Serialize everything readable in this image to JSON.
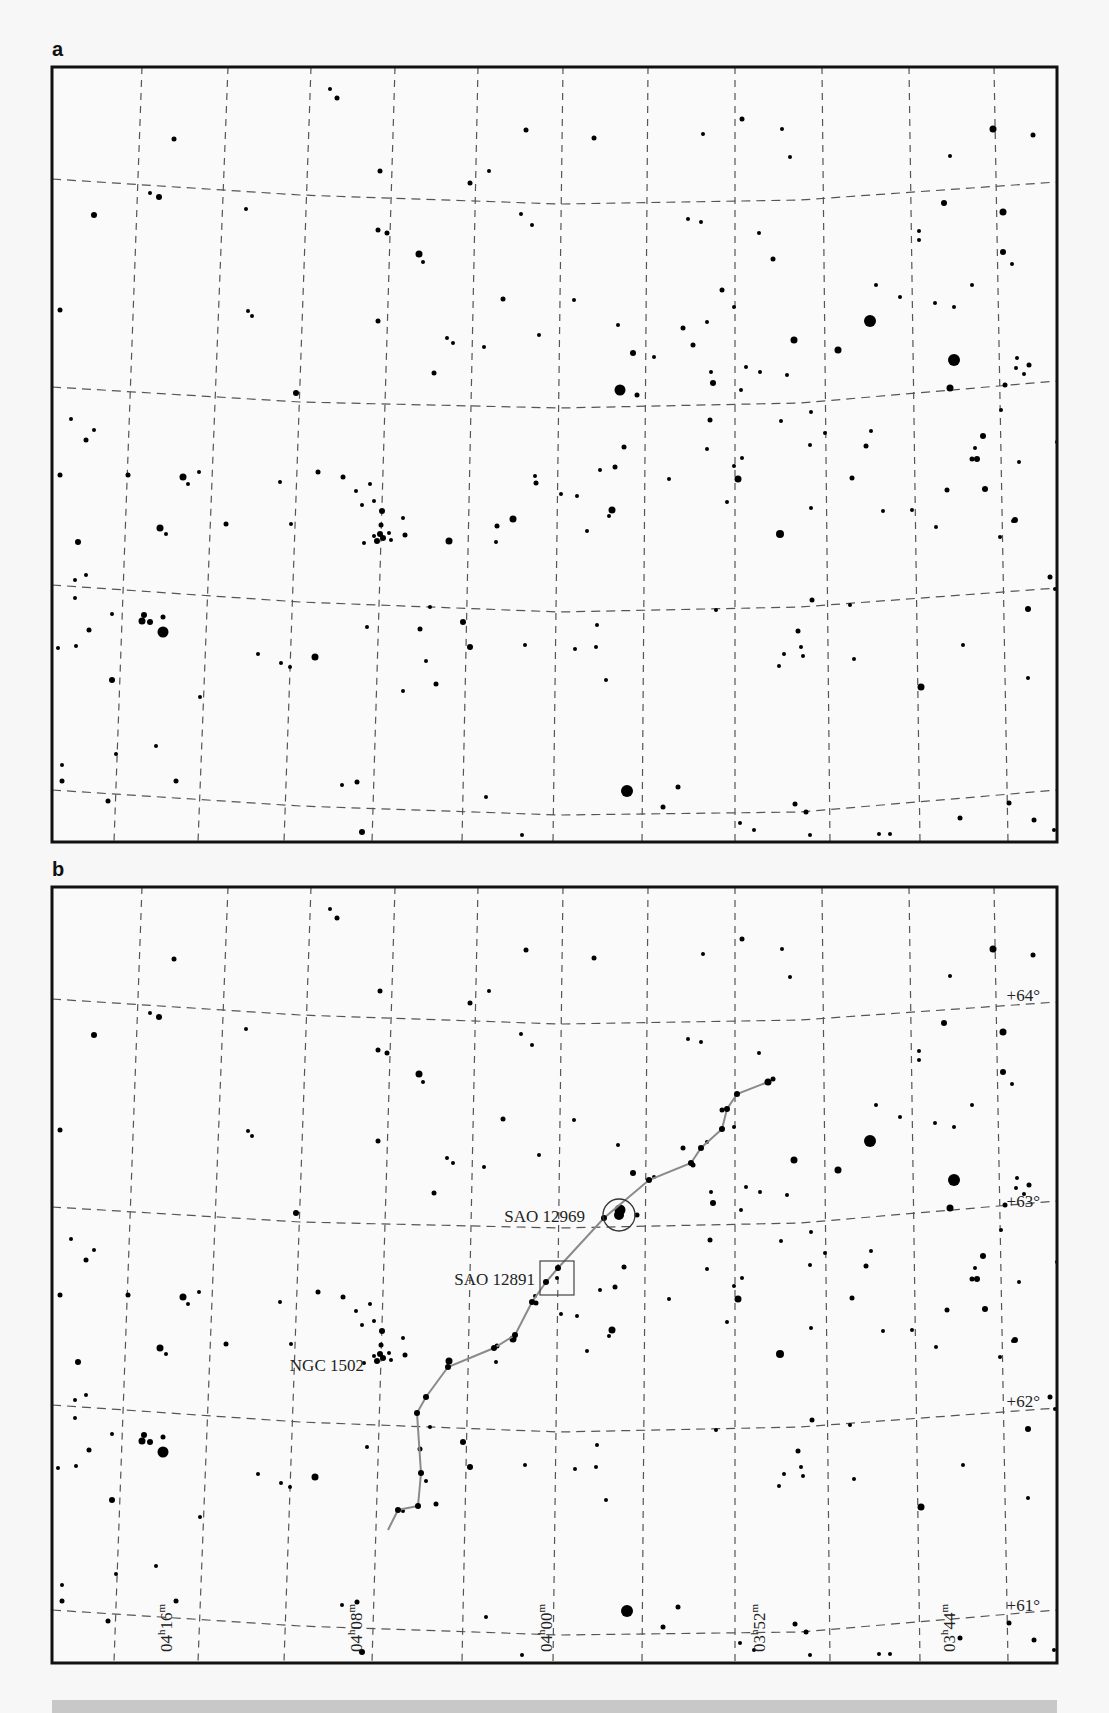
{
  "panels": [
    {
      "label": "a",
      "x": 52,
      "y": 67,
      "w": 1005,
      "h": 775
    },
    {
      "label": "b",
      "x": 52,
      "y": 887,
      "w": 1005,
      "h": 776
    }
  ],
  "grid": {
    "ra_lines_top_x": [
      142,
      311,
      478,
      563,
      648,
      735,
      822,
      1007
    ],
    "ra_lines": [
      [
        [
          142,
          67
        ],
        [
          114,
          842
        ]
      ],
      [
        [
          228,
          67
        ],
        [
          198,
          842
        ]
      ],
      [
        [
          311,
          67
        ],
        [
          284,
          842
        ]
      ],
      [
        [
          395,
          67
        ],
        [
          372,
          842
        ]
      ],
      [
        [
          478,
          67
        ],
        [
          462,
          842
        ]
      ],
      [
        [
          563,
          67
        ],
        [
          553,
          842
        ]
      ],
      [
        [
          648,
          67
        ],
        [
          642,
          842
        ]
      ],
      [
        [
          735,
          67
        ],
        [
          735,
          842
        ]
      ],
      [
        [
          822,
          67
        ],
        [
          830,
          842
        ]
      ],
      [
        [
          909,
          67
        ],
        [
          920,
          842
        ]
      ],
      [
        [
          994,
          67
        ],
        [
          1008,
          842
        ]
      ]
    ],
    "dec_lines": [
      [
        [
          52,
          179
        ],
        [
          300,
          195
        ],
        [
          560,
          204
        ],
        [
          800,
          200
        ],
        [
          1057,
          182
        ]
      ],
      [
        [
          52,
          387
        ],
        [
          300,
          402
        ],
        [
          560,
          408
        ],
        [
          800,
          403
        ],
        [
          1057,
          381
        ]
      ],
      [
        [
          52,
          585
        ],
        [
          300,
          602
        ],
        [
          560,
          612
        ],
        [
          800,
          607
        ],
        [
          1057,
          588
        ]
      ],
      [
        [
          52,
          790
        ],
        [
          300,
          806
        ],
        [
          560,
          815
        ],
        [
          800,
          812
        ],
        [
          1057,
          790
        ]
      ]
    ]
  },
  "dec_labels": [
    {
      "text": "+64°",
      "x": 1040,
      "y": 1001
    },
    {
      "text": "+63°",
      "x": 1040,
      "y": 1207
    },
    {
      "text": "+62°",
      "x": 1040,
      "y": 1407
    },
    {
      "text": "+61°",
      "x": 1040,
      "y": 1611
    }
  ],
  "ra_labels": [
    {
      "text": "04h16m",
      "x": 172,
      "y": 1652
    },
    {
      "text": "04h08m",
      "x": 362,
      "y": 1652
    },
    {
      "text": "04h00m",
      "x": 552,
      "y": 1652
    },
    {
      "text": "03h52m",
      "x": 765,
      "y": 1652
    },
    {
      "text": "03h44m",
      "x": 955,
      "y": 1652
    }
  ],
  "objects": [
    {
      "name": "SAO 12969",
      "marker": "circle",
      "x": 619,
      "y": 1215,
      "r": 16,
      "label_x": 585,
      "label_y": 1222
    },
    {
      "name": "SAO 12891",
      "marker": "square",
      "x": 557,
      "y": 1278,
      "size": 34,
      "label_x": 535,
      "label_y": 1285
    },
    {
      "name": "NGC 1502",
      "marker": "cluster",
      "x": 381,
      "y": 1364,
      "label_x": 364,
      "label_y": 1371
    }
  ],
  "path_points": [
    [
      388,
      1530
    ],
    [
      398,
      1510
    ],
    [
      418,
      1506
    ],
    [
      421,
      1473
    ],
    [
      417,
      1413
    ],
    [
      426,
      1397
    ],
    [
      448,
      1367
    ],
    [
      494,
      1348
    ],
    [
      515,
      1335
    ],
    [
      532,
      1302
    ],
    [
      546,
      1282
    ],
    [
      558,
      1268
    ],
    [
      604,
      1218
    ],
    [
      649,
      1180
    ],
    [
      691,
      1163
    ],
    [
      701,
      1148
    ],
    [
      722,
      1129
    ],
    [
      727,
      1109
    ],
    [
      737,
      1094
    ],
    [
      768,
      1082
    ]
  ],
  "stars": [
    [
      330,
      89,
      2
    ],
    [
      337,
      98,
      2.5
    ],
    [
      174,
      139,
      2.5
    ],
    [
      526,
      130,
      2.5
    ],
    [
      594,
      138,
      2.5
    ],
    [
      742,
      119,
      2.5
    ],
    [
      782,
      129,
      2
    ],
    [
      993,
      129,
      3.5
    ],
    [
      1033,
      135,
      2.5
    ],
    [
      380,
      171,
      2.5
    ],
    [
      489,
      171,
      2
    ],
    [
      470,
      183,
      2.5
    ],
    [
      703,
      134,
      2
    ],
    [
      790,
      157,
      2
    ],
    [
      950,
      156,
      2
    ],
    [
      944,
      203,
      3
    ],
    [
      159,
      197,
      3
    ],
    [
      94,
      215,
      3
    ],
    [
      150,
      193,
      2
    ],
    [
      246,
      209,
      2
    ],
    [
      378,
      230,
      2.5
    ],
    [
      387,
      233,
      2.5
    ],
    [
      521,
      214,
      2
    ],
    [
      532,
      225,
      2
    ],
    [
      688,
      219,
      2
    ],
    [
      701,
      222,
      2
    ],
    [
      419,
      254,
      3.5
    ],
    [
      423,
      262,
      2
    ],
    [
      759,
      233,
      2
    ],
    [
      773,
      259,
      2.5
    ],
    [
      919,
      231,
      2
    ],
    [
      919,
      240,
      2
    ],
    [
      1012,
      264,
      2
    ],
    [
      1003,
      252,
      3
    ],
    [
      60,
      310,
      2.5
    ],
    [
      248,
      311,
      2
    ],
    [
      252,
      316,
      2
    ],
    [
      378,
      321,
      2.5
    ],
    [
      503,
      299,
      2.5
    ],
    [
      574,
      300,
      2
    ],
    [
      722,
      290,
      2.5
    ],
    [
      683,
      328,
      2.5
    ],
    [
      707,
      322,
      2
    ],
    [
      734,
      307,
      2
    ],
    [
      876,
      285,
      2
    ],
    [
      900,
      297,
      2
    ],
    [
      935,
      303,
      2
    ],
    [
      954,
      307,
      2
    ],
    [
      972,
      285,
      2
    ],
    [
      447,
      338,
      2
    ],
    [
      453,
      343,
      2
    ],
    [
      484,
      347,
      2
    ],
    [
      539,
      335,
      2
    ],
    [
      618,
      325,
      2
    ],
    [
      633,
      353,
      3
    ],
    [
      654,
      357,
      2
    ],
    [
      693,
      345,
      2.5
    ],
    [
      746,
      367,
      2
    ],
    [
      760,
      372,
      2
    ],
    [
      794,
      340,
      3.5
    ],
    [
      838,
      350,
      3.5
    ],
    [
      870,
      321,
      6
    ],
    [
      1017,
      358,
      2
    ],
    [
      1029,
      365,
      2.5
    ],
    [
      1016,
      368,
      2
    ],
    [
      1024,
      374,
      2
    ],
    [
      296,
      393,
      3
    ],
    [
      434,
      373,
      2.5
    ],
    [
      620,
      390,
      5.5
    ],
    [
      637,
      395,
      2.5
    ],
    [
      711,
      372,
      2
    ],
    [
      713,
      383,
      3
    ],
    [
      710,
      420,
      2.5
    ],
    [
      741,
      390,
      2
    ],
    [
      787,
      375,
      2
    ],
    [
      781,
      421,
      2
    ],
    [
      811,
      412,
      2
    ],
    [
      954,
      360,
      6
    ],
    [
      950,
      388,
      3.5
    ],
    [
      1005,
      385,
      2.5
    ],
    [
      1001,
      410,
      2
    ],
    [
      71,
      419,
      2
    ],
    [
      86,
      440,
      2.5
    ],
    [
      60,
      475,
      2.5
    ],
    [
      94,
      430,
      2
    ],
    [
      183,
      477,
      3.5
    ],
    [
      188,
      484,
      2
    ],
    [
      128,
      475,
      2.5
    ],
    [
      280,
      482,
      2
    ],
    [
      318,
      472,
      2.5
    ],
    [
      343,
      477,
      2.5
    ],
    [
      356,
      491,
      2
    ],
    [
      364,
      543,
      2
    ],
    [
      370,
      484,
      2
    ],
    [
      535,
      476,
      2
    ],
    [
      561,
      494,
      2
    ],
    [
      536,
      483,
      2.5
    ],
    [
      577,
      496,
      2
    ],
    [
      600,
      470,
      2
    ],
    [
      615,
      467,
      2.5
    ],
    [
      624,
      447,
      2.5
    ],
    [
      669,
      479,
      2
    ],
    [
      707,
      449,
      2
    ],
    [
      742,
      458,
      2
    ],
    [
      727,
      502,
      2
    ],
    [
      810,
      445,
      2
    ],
    [
      825,
      433,
      2
    ],
    [
      871,
      431,
      2
    ],
    [
      852,
      478,
      2.5
    ],
    [
      866,
      446,
      2.5
    ],
    [
      975,
      448,
      2
    ],
    [
      983,
      436,
      3
    ],
    [
      977,
      459,
      3
    ],
    [
      1019,
      462,
      2
    ],
    [
      78,
      542,
      3
    ],
    [
      160,
      528,
      3.5
    ],
    [
      166,
      534,
      2
    ],
    [
      199,
      472,
      2
    ],
    [
      226,
      524,
      2.5
    ],
    [
      291,
      524,
      2
    ],
    [
      362,
      505,
      2
    ],
    [
      374,
      501,
      2
    ],
    [
      382,
      511,
      3
    ],
    [
      381,
      525,
      2.5
    ],
    [
      405,
      535,
      2.5
    ],
    [
      403,
      518,
      2
    ],
    [
      449,
      541,
      3.5
    ],
    [
      497,
      526,
      2.5
    ],
    [
      513,
      519,
      3.5
    ],
    [
      496,
      542,
      2
    ],
    [
      587,
      531,
      2
    ],
    [
      609,
      516,
      2
    ],
    [
      612,
      510,
      3.5
    ],
    [
      734,
      466,
      2
    ],
    [
      738,
      479,
      3.5
    ],
    [
      812,
      600,
      2.5
    ],
    [
      780,
      534,
      4
    ],
    [
      811,
      508,
      2
    ],
    [
      883,
      511,
      2
    ],
    [
      912,
      510,
      2
    ],
    [
      936,
      527,
      2
    ],
    [
      947,
      490,
      2.5
    ],
    [
      972,
      459,
      2.5
    ],
    [
      985,
      489,
      3
    ],
    [
      1013,
      521,
      2
    ],
    [
      1058,
      524,
      2
    ],
    [
      1057,
      442,
      2
    ],
    [
      1000,
      537,
      2
    ],
    [
      1050,
      577,
      2.5
    ],
    [
      1055,
      589,
      2
    ],
    [
      75,
      580,
      2
    ],
    [
      75,
      598,
      2
    ],
    [
      86,
      575,
      2
    ],
    [
      163,
      617,
      2.5
    ],
    [
      112,
      614,
      2
    ],
    [
      150,
      622,
      3
    ],
    [
      163,
      632,
      5.5
    ],
    [
      144,
      615,
      3
    ],
    [
      89,
      630,
      2.5
    ],
    [
      76,
      646,
      2
    ],
    [
      58,
      648,
      2
    ],
    [
      315,
      657,
      3.5
    ],
    [
      290,
      667,
      2
    ],
    [
      367,
      627,
      2
    ],
    [
      430,
      607,
      2
    ],
    [
      420,
      629,
      2.5
    ],
    [
      426,
      661,
      2
    ],
    [
      463,
      622,
      3
    ],
    [
      470,
      647,
      3
    ],
    [
      403,
      691,
      2
    ],
    [
      436,
      684,
      2.5
    ],
    [
      525,
      645,
      2
    ],
    [
      575,
      649,
      2
    ],
    [
      597,
      625,
      2
    ],
    [
      596,
      647,
      2
    ],
    [
      606,
      680,
      2
    ],
    [
      716,
      610,
      2
    ],
    [
      798,
      631,
      2.5
    ],
    [
      801,
      647,
      2
    ],
    [
      803,
      656,
      2
    ],
    [
      784,
      654,
      2
    ],
    [
      779,
      666,
      2
    ],
    [
      850,
      605,
      2
    ],
    [
      854,
      659,
      2
    ],
    [
      921,
      687,
      3.5
    ],
    [
      963,
      645,
      2
    ],
    [
      1028,
      609,
      3
    ],
    [
      1028,
      678,
      2
    ],
    [
      112,
      680,
      3
    ],
    [
      116,
      754,
      2
    ],
    [
      62,
      765,
      2
    ],
    [
      62,
      781,
      2.5
    ],
    [
      108,
      801,
      2.5
    ],
    [
      176,
      781,
      2.5
    ],
    [
      156,
      746,
      2
    ],
    [
      200,
      697,
      2
    ],
    [
      258,
      654,
      2
    ],
    [
      281,
      663,
      2
    ],
    [
      342,
      785,
      2
    ],
    [
      357,
      782,
      2.5
    ],
    [
      486,
      797,
      2
    ],
    [
      627,
      791,
      6
    ],
    [
      663,
      807,
      2.5
    ],
    [
      678,
      787,
      2.5
    ],
    [
      740,
      823,
      2
    ],
    [
      754,
      830,
      2
    ],
    [
      795,
      804,
      2.5
    ],
    [
      806,
      812,
      2.5
    ],
    [
      879,
      834,
      2
    ],
    [
      960,
      818,
      2.5
    ],
    [
      890,
      834,
      2
    ],
    [
      1009,
      803,
      2.5
    ],
    [
      1034,
      820,
      2.5
    ],
    [
      1054,
      830,
      2
    ],
    [
      362,
      832,
      3
    ],
    [
      522,
      835,
      2
    ],
    [
      810,
      835,
      2
    ]
  ],
  "highlighted_stars_a_only": [
    [
      1003,
      212,
      3.5
    ],
    [
      1015,
      520,
      3
    ],
    [
      142,
      621,
      3.5
    ],
    [
      380,
      534,
      3
    ],
    [
      377,
      541,
      3
    ],
    [
      383,
      538,
      3
    ],
    [
      389,
      533,
      2
    ],
    [
      391,
      540,
      2
    ],
    [
      374,
      536,
      2
    ]
  ],
  "colors": {
    "frame": "#111111",
    "grid": "#555555",
    "star": "#000000",
    "path": "#8a8a8a",
    "label": "#222222",
    "background": "#fafafa"
  }
}
